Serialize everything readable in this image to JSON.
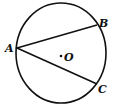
{
  "diagram": {
    "type": "circle-with-chords",
    "circle": {
      "center_label": "O",
      "cx": 61,
      "cy": 53,
      "rx": 45,
      "ry": 50
    },
    "points": [
      {
        "label": "A",
        "x": 17,
        "y": 48,
        "label_x": 5,
        "label_y": 52
      },
      {
        "label": "B",
        "x": 97,
        "y": 25,
        "label_x": 99,
        "label_y": 27
      },
      {
        "label": "C",
        "x": 97,
        "y": 84,
        "label_x": 98,
        "label_y": 93
      },
      {
        "label": "O",
        "x": 61,
        "y": 56,
        "label_x": 64,
        "label_y": 61
      }
    ],
    "segments": [
      {
        "from": "A",
        "to": "B"
      },
      {
        "from": "A",
        "to": "C"
      }
    ],
    "stroke_color": "#111111"
  }
}
